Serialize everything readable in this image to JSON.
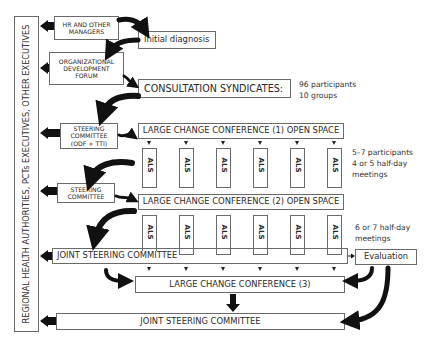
{
  "side_label": "REGIONAL HEALTH AUTHORITIES, PCTs EXECUTIVES, OTHER EXECUTIVES",
  "boxes": {
    "hr_managers": "HR AND OTHER MANAGERS",
    "initial_diagnosis": "Initial diagnosis",
    "odf_line1": "ORGANIZATIONAL",
    "odf_line2": "DEVELOPMENT",
    "odf_line3": "FORUM",
    "consultation": "CONSULTATION SYNDICATES:",
    "steering1_line1": "STEERING",
    "steering1_line2": "COMMITTEE",
    "steering1_line3": "(ODF + TTI)",
    "lcc1": "LARGE CHANGE CONFERENCE (1) OPEN SPACE",
    "steering2_line1": "STEERING",
    "steering2_line2": "COMMITTEE",
    "lcc2": "LARGE CHANGE CONFERENCE (2) OPEN SPACE",
    "joint1": "JOINT STEERING COMMITTEE",
    "evaluation": "Evaluation",
    "lcc3": "LARGE CHANGE CONFERENCE (3)",
    "joint2": "JOINT STEERING COMMITTEE"
  },
  "als_label": "ALS",
  "notes": {
    "consultation_line1": "96 participants",
    "consultation_line2": "10 groups",
    "als1_line1": "5–7 participants",
    "als1_line2": "4 or 5 half-day",
    "als1_line3": "meetings",
    "als2_line1": "6 or 7 half-day",
    "als2_line2": "meetings"
  }
}
